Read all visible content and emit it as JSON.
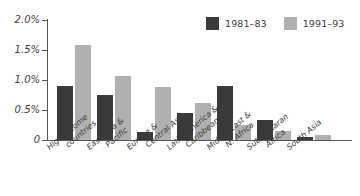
{
  "chart_data": {
    "type": "bar",
    "title": "",
    "xlabel": "",
    "ylabel": "",
    "ylim": [
      0,
      2.0
    ],
    "grid": false,
    "legend_position": "top-right",
    "axis_tick_format": "percent",
    "categories": [
      "High-income countries",
      "East Asia & Pacific",
      "Europe & Central Asia",
      "Latin America & Caribbean",
      "Middle East & N. Africa",
      "Sub-Saharan Africa",
      "South Asia"
    ],
    "category_lines": [
      [
        "High-income",
        "countries"
      ],
      [
        "East Asia &",
        "Pacific"
      ],
      [
        "Europe &",
        "Central Asia"
      ],
      [
        "Latin America &",
        "Caribbean"
      ],
      [
        "Middle East &",
        "N. Africa"
      ],
      [
        "Sub-Saharan",
        "Africa"
      ],
      [
        "South Asia",
        ""
      ]
    ],
    "series": [
      {
        "name": "1981–83",
        "color": "#3a3a3a",
        "values": [
          0.9,
          0.75,
          0.13,
          0.45,
          0.9,
          0.33,
          0.05
        ]
      },
      {
        "name": "1991–93",
        "color": "#b0b0b0",
        "values": [
          1.59,
          1.07,
          0.88,
          0.62,
          0.25,
          0.15,
          0.08
        ]
      }
    ],
    "y_ticks": [
      {
        "value": 2.0,
        "label": "2.0%"
      },
      {
        "value": 1.5,
        "label": "1.5%"
      },
      {
        "value": 1.0,
        "label": "1.0%"
      },
      {
        "value": 0.5,
        "label": "0.5%"
      },
      {
        "value": 0.0,
        "label": "0"
      }
    ]
  },
  "legend": {
    "entries": [
      {
        "label": "1981–83",
        "color": "#3a3a3a"
      },
      {
        "label": "1991–93",
        "color": "#b0b0b0"
      }
    ]
  },
  "colors": {
    "series_1981_83": "#3a3a3a",
    "series_1991_93": "#b0b0b0",
    "axis": "#555555",
    "text": "#3d3d3d",
    "background": "#ffffff"
  }
}
